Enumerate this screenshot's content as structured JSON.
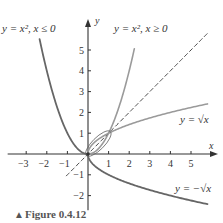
{
  "figure": {
    "caption_marker": "▲",
    "caption": "Figure 0.4.12"
  },
  "colors": {
    "axis": "#333333",
    "curve_dark": "#666666",
    "curve_light": "#9a9a9a",
    "dashed": "#333333"
  },
  "chart_data": {
    "type": "line",
    "title": "",
    "xlabel": "x",
    "ylabel": "y",
    "xlim": [
      -3.5,
      6
    ],
    "ylim": [
      -2.5,
      6
    ],
    "grid": false,
    "x_ticks": [
      -3,
      -2,
      -1,
      1,
      2,
      3,
      4,
      5
    ],
    "x_tick_labels": [
      "−3",
      "−2",
      "−1",
      "1",
      "2",
      "3",
      "4",
      "5"
    ],
    "y_ticks": [
      -2,
      -1,
      1,
      2,
      3,
      4,
      5
    ],
    "y_tick_labels": [
      "−2",
      "−1",
      "1",
      "2",
      "3",
      "4",
      "5"
    ],
    "series": [
      {
        "name": "y = x², x ≤ 0",
        "label": "y = x², x ≤ 0",
        "expr": "x^2",
        "domain": [
          -2.35,
          0
        ],
        "style": "solid-dark"
      },
      {
        "name": "y = x², x ≥ 0",
        "label": "y = x², x ≥ 0",
        "expr": "x^2",
        "domain": [
          0,
          2.25
        ],
        "style": "solid-light"
      },
      {
        "name": "y = x",
        "label": "",
        "expr": "x",
        "domain": [
          -1.05,
          5.8
        ],
        "style": "dashed"
      },
      {
        "name": "y = √x",
        "label": "y = √x",
        "expr": "sqrt(x)",
        "domain": [
          0,
          5.8
        ],
        "style": "solid-light"
      },
      {
        "name": "y = −√x",
        "label": "y = −√x",
        "expr": "-sqrt(x)",
        "domain": [
          0,
          5.8
        ],
        "style": "solid-dark"
      }
    ],
    "annotations": [
      {
        "text": "y = x², x ≤ 0",
        "near": [
          -2.4,
          5.6
        ]
      },
      {
        "text": "y = x², x ≥ 0",
        "near": [
          1.2,
          5.6
        ]
      },
      {
        "text": "y = √x",
        "near": [
          4.6,
          1.6
        ]
      },
      {
        "text": "y = −√x",
        "near": [
          4.6,
          -1.9
        ]
      }
    ],
    "highlight": "ellipse loop between y=x² and y=√x from (0,0) to (1,1)"
  },
  "labels": {
    "x_axis": "x",
    "y_axis": "y",
    "left_parabola": "y = x², x ≤ 0",
    "right_parabola": "y = x², x ≥ 0",
    "sqrt": "y = √x",
    "neg_sqrt": "y = −√x"
  }
}
